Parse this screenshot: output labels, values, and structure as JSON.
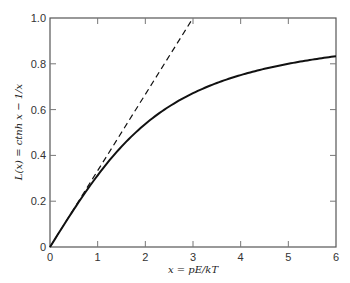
{
  "chart_data": {
    "type": "line",
    "title": "",
    "xlabel": "x = pE/kT",
    "ylabel": "L(x) = ctnh x − 1/x",
    "xlim": [
      0,
      6
    ],
    "ylim": [
      0,
      1.0
    ],
    "xticks": [
      "0",
      "1",
      "2",
      "3",
      "4",
      "5",
      "6"
    ],
    "yticks": [
      "0",
      "0.2",
      "0.4",
      "0.6",
      "0.8",
      "1.0"
    ],
    "grid": false,
    "legend": null,
    "series": [
      {
        "name": "L(x) = ctnh x − 1/x",
        "style": "solid",
        "x": [
          0,
          0.25,
          0.5,
          0.75,
          1,
          1.5,
          2,
          2.5,
          3,
          3.5,
          4,
          4.5,
          5,
          5.5,
          6
        ],
        "y": [
          0,
          0.0831,
          0.164,
          0.2413,
          0.313,
          0.4381,
          0.5373,
          0.6136,
          0.6716,
          0.7161,
          0.7507,
          0.778,
          0.8001,
          0.8182,
          0.8333
        ]
      },
      {
        "name": "x/3 (initial slope)",
        "style": "dashed",
        "x": [
          0,
          3
        ],
        "y": [
          0,
          1.0
        ]
      }
    ]
  }
}
